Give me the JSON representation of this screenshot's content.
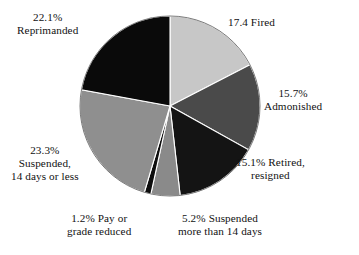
{
  "chart_data": {
    "type": "pie",
    "title": "",
    "subtitle": "",
    "xlabel": "",
    "ylabel": "",
    "grid": false,
    "legend_position": "outside-callout-labels",
    "start_angle_deg": 0,
    "direction": "clockwise",
    "categories": [
      "Fired",
      "Admonished",
      "Retired, resigned",
      "Suspended more than 14 days",
      "Pay or grade reduced",
      "Suspended, 14 days or less",
      "Reprimanded"
    ],
    "values": [
      17.4,
      15.7,
      15.1,
      5.2,
      1.2,
      23.3,
      22.1
    ],
    "value_unit": "percent",
    "colors": [
      "#c7c7c7",
      "#4a4a4a",
      "#141414",
      "#8a8a8a",
      "#0d0d0d",
      "#8f8f8f",
      "#0a0a0a"
    ],
    "slices": [
      {
        "name": "Fired",
        "value": 17.4,
        "color": "#c7c7c7",
        "label_lines": [
          "17.4 Fired"
        ],
        "label_position": "upper-right"
      },
      {
        "name": "Admonished",
        "value": 15.7,
        "color": "#4a4a4a",
        "label_lines": [
          "15.7%",
          "Admonished"
        ],
        "label_position": "right"
      },
      {
        "name": "Retired, resigned",
        "value": 15.1,
        "color": "#141414",
        "label_lines": [
          "15.1% Retired,",
          "resigned"
        ],
        "label_position": "lower-right"
      },
      {
        "name": "Suspended more than 14 days",
        "value": 5.2,
        "color": "#8a8a8a",
        "label_lines": [
          "5.2% Suspended",
          "more than 14 days"
        ],
        "label_position": "bottom-right"
      },
      {
        "name": "Pay or grade reduced",
        "value": 1.2,
        "color": "#0d0d0d",
        "label_lines": [
          "1.2% Pay or",
          "grade reduced"
        ],
        "label_position": "bottom-left"
      },
      {
        "name": "Suspended, 14 days or less",
        "value": 23.3,
        "color": "#8f8f8f",
        "label_lines": [
          "23.3%",
          "Suspended,",
          "14 days or less"
        ],
        "label_position": "left"
      },
      {
        "name": "Reprimanded",
        "value": 22.1,
        "color": "#0a0a0a",
        "label_lines": [
          "22.1%",
          "Reprimanded"
        ],
        "label_position": "upper-left"
      }
    ]
  },
  "labels": {
    "fired": {
      "l1": "17.4 Fired"
    },
    "admonished": {
      "l1": "15.7%",
      "l2": "Admonished"
    },
    "retired": {
      "l1": "15.1% Retired,",
      "l2": "resigned"
    },
    "suspended_more": {
      "l1": "5.2% Suspended",
      "l2": "more than 14 days"
    },
    "pay_reduced": {
      "l1": "1.2% Pay or",
      "l2": "grade reduced"
    },
    "suspended_less": {
      "l1": "23.3%",
      "l2": "Suspended,",
      "l3": "14 days or less"
    },
    "reprimanded": {
      "l1": "22.1%",
      "l2": "Reprimanded"
    }
  },
  "geometry": {
    "cx": 170,
    "cy": 106,
    "r": 90
  }
}
